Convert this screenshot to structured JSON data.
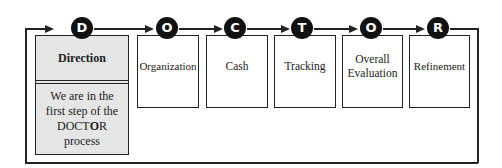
{
  "diagram": {
    "title": "DOCTOR process",
    "steps": [
      {
        "letter": "D",
        "label": "Direction",
        "active": true
      },
      {
        "letter": "O",
        "label": "Organization"
      },
      {
        "letter": "C",
        "label": "Cash"
      },
      {
        "letter": "T",
        "label": "Tracking"
      },
      {
        "letter": "O",
        "label": "Overall Evaluation"
      },
      {
        "letter": "R",
        "label": "Refinement"
      }
    ],
    "active_note": {
      "line1": "We are in the",
      "line2": "first step of the",
      "acronym_pre": "DOCT",
      "acronym_bold": "O",
      "acronym_post": "R",
      "line4": "process"
    },
    "colors": {
      "line": "#222222",
      "circle": "#111111",
      "active_fill": "#e6e6e6"
    }
  }
}
